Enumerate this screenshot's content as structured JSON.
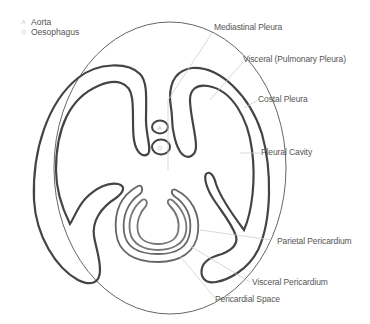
{
  "legend": {
    "items": [
      {
        "symbol": "A",
        "label": "Aorta"
      },
      {
        "symbol": "O",
        "label": "Oesophagus"
      }
    ]
  },
  "labels": {
    "mediastinal_pleura": "Mediastinal Pleura",
    "visceral_pleura": "Visceral (Pulmonary Pleura)",
    "costal_pleura": "Costal Pleura",
    "pleural_cavity": "Pleural Cavity",
    "parietal_pericardium": "Parietal Pericardium",
    "visceral_pericardium": "Visceral Pericardium",
    "pericardial_space": "Pericardial Space"
  },
  "structures": {
    "aorta_marker": "A",
    "oesophagus_marker": "O"
  },
  "colors": {
    "outline_dark": "#444444",
    "outline_thin": "#666666",
    "pericardium": "#888888",
    "leader_line": "#cccccc",
    "text": "#555555"
  }
}
